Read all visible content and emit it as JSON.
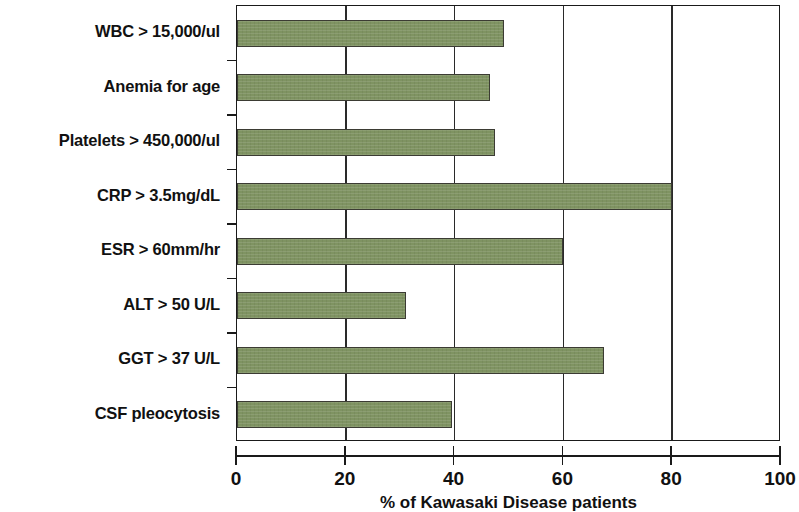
{
  "chart_data": {
    "type": "bar",
    "orientation": "horizontal",
    "title": "",
    "xlabel": "% of Kawasaki Disease patients",
    "ylabel": "",
    "xlim": [
      0,
      100
    ],
    "xticks": [
      0,
      20,
      40,
      60,
      80,
      100
    ],
    "xtick_labels": [
      "0",
      "20",
      "40",
      "60",
      "80",
      "100"
    ],
    "grid": true,
    "grid_axis": "x",
    "legend": false,
    "bar_color": "#7f9362",
    "bar_edge_color": "#3b3b33",
    "axis_color": "#1a1a1a",
    "categories": [
      "WBC > 15,000/ul",
      "Anemia for age",
      "Platelets > 450,000/ul",
      "CRP > 3.5mg/dL",
      "ESR > 60mm/hr",
      "ALT > 50 U/L",
      "GGT > 37 U/L",
      "CSF pleocytosis"
    ],
    "values": [
      49,
      46.5,
      47.5,
      80,
      60,
      31,
      67.5,
      39.5
    ],
    "bars": [
      {
        "label": "WBC > 15,000/ul",
        "value": 49
      },
      {
        "label": "Anemia for age",
        "value": 46.5
      },
      {
        "label": "Platelets > 450,000/ul",
        "value": 47.5
      },
      {
        "label": "CRP > 3.5mg/dL",
        "value": 80
      },
      {
        "label": "ESR > 60mm/hr",
        "value": 60
      },
      {
        "label": "ALT > 50 U/L",
        "value": 31
      },
      {
        "label": "GGT > 37 U/L",
        "value": 67.5
      },
      {
        "label": "CSF pleocytosis",
        "value": 39.5
      }
    ]
  }
}
